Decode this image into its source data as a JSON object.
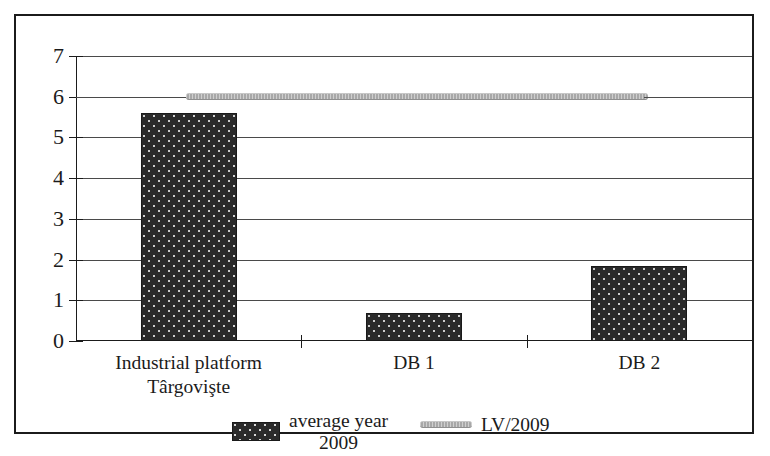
{
  "chart_data": {
    "type": "bar",
    "title": "",
    "xlabel": "",
    "ylabel": "",
    "ylim": [
      0,
      7
    ],
    "yticks": [
      "0",
      "1",
      "2",
      "3",
      "4",
      "5",
      "6",
      "7"
    ],
    "grid": true,
    "legend_position": "bottom",
    "categories": [
      "Industrial platform\nTârgovişte",
      "DB 1",
      "DB 2"
    ],
    "series": [
      {
        "name": "average year\n2009",
        "type": "bar",
        "values": [
          5.6,
          0.7,
          1.85
        ]
      },
      {
        "name": "LV/2009",
        "type": "line",
        "values": [
          6,
          6,
          6
        ]
      }
    ]
  },
  "axis": {
    "y_tick_labels": [
      "7",
      "6",
      "5",
      "4",
      "3",
      "2",
      "1",
      "0"
    ],
    "category_labels": [
      {
        "line1": "Industrial platform",
        "line2": "Târgovişte"
      },
      {
        "line1": "DB 1",
        "line2": ""
      },
      {
        "line1": "DB 2",
        "line2": ""
      }
    ]
  },
  "legend": {
    "entries": [
      {
        "label": "average year\n2009",
        "marker": "bar-swatch-dotted-dark"
      },
      {
        "label": "LV/2009",
        "marker": "line-swatch-gray"
      }
    ]
  },
  "colors": {
    "bar_fill": "#2b2b2b",
    "line_series": "#a8a8a8",
    "axis": "#1b1b1b",
    "gridline": "#4a4a4a",
    "frame": "#1b1b1b",
    "background": "#ffffff"
  }
}
